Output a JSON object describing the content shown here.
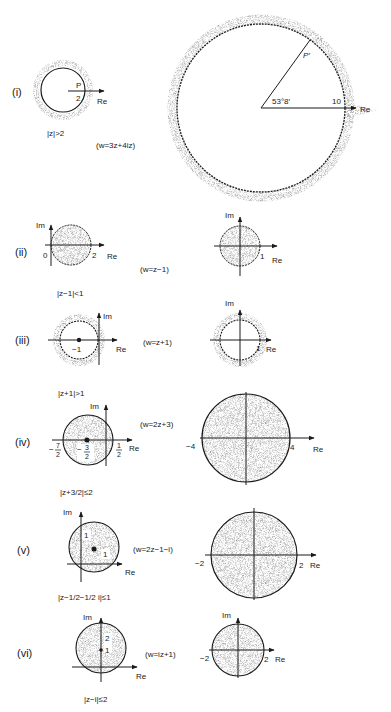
{
  "figure": {
    "stipple_color": "#7a7a7a",
    "line_color": "#1a1a1a",
    "rows": [
      {
        "id": "i",
        "label": "(i)",
        "mapping": "(w=3z+4iz)",
        "z_region": "|z|>2",
        "z_labels": {
          "point": "P",
          "radius": "2",
          "axis": "Re"
        },
        "w_labels": {
          "point": "P′",
          "angle": "53°8′",
          "radius": "10",
          "axis": "Re"
        }
      },
      {
        "id": "ii",
        "label": "(ii)",
        "mapping": "(w=z−1)",
        "z_region": "|z−1|<1",
        "z_labels": {
          "im": "Im",
          "re": "Re",
          "left": "0",
          "right": "2"
        },
        "w_labels": {
          "im": "Im",
          "re": "Re",
          "right": "1"
        }
      },
      {
        "id": "iii",
        "label": "(iii)",
        "mapping": "(w=z+1)",
        "z_region": "|z+1|>1",
        "z_labels": {
          "im": "Im",
          "re": "Re",
          "center": "−1"
        },
        "w_labels": {
          "im": "Im",
          "re": "Re",
          "right": "1"
        }
      },
      {
        "id": "iv",
        "label": "(iv)",
        "mapping": "(w=2z+3)",
        "z_region": "|z+3/2|≤2",
        "z_labels": {
          "im": "Im",
          "re": "Re",
          "left_num": "7",
          "center_num": "3",
          "right_num": "1",
          "den": "2",
          "minus": "−"
        },
        "w_labels": {
          "im": "Im",
          "re": "Re",
          "left": "−4",
          "right": "4"
        }
      },
      {
        "id": "v",
        "label": "(v)",
        "mapping": "(w=2z−1−i)",
        "z_region": "|z−1/2−1/2 i|≤1",
        "z_labels": {
          "im": "Im",
          "re": "Re",
          "im_tick": "1",
          "re_tick": "1"
        },
        "w_labels": {
          "im": "Im",
          "re": "Re",
          "left": "−2",
          "right": "2"
        }
      },
      {
        "id": "vi",
        "label": "(vi)",
        "mapping": "(w=iz+1)",
        "z_region": "|z−i|≤2",
        "z_labels": {
          "im": "Im",
          "re": "Re",
          "tick1": "1",
          "tick2": "2"
        },
        "w_labels": {
          "im": "Im",
          "re": "Re",
          "left": "−2",
          "right": "2"
        }
      }
    ]
  }
}
